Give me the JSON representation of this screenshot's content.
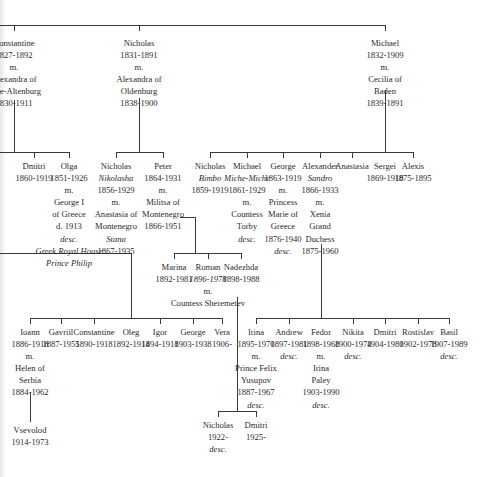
{
  "generation1": [
    {
      "id": "constantine",
      "lines": [
        {
          "t": "Constantine"
        },
        {
          "t": "1827-1892"
        },
        {
          "t": "m."
        },
        {
          "t": "Alexandra of"
        },
        {
          "t": "Saxe-Altenburg"
        },
        {
          "t": "1830-1911"
        }
      ]
    },
    {
      "id": "nicholas",
      "lines": [
        {
          "t": "Nicholas"
        },
        {
          "t": "1831-1891"
        },
        {
          "t": "m."
        },
        {
          "t": "Alexandra of"
        },
        {
          "t": "Oldenburg"
        },
        {
          "t": "1838-1900"
        }
      ]
    },
    {
      "id": "michael",
      "lines": [
        {
          "t": "Michael"
        },
        {
          "t": "1832-1909"
        },
        {
          "t": "m."
        },
        {
          "t": "Cecilia of"
        },
        {
          "t": "Baden"
        },
        {
          "t": "1839-1891"
        }
      ]
    }
  ],
  "generation2": [
    {
      "id": "dmitri-c",
      "lines": [
        {
          "t": "Dmitri"
        },
        {
          "t": "1860-1919"
        }
      ]
    },
    {
      "id": "olga",
      "lines": [
        {
          "t": "Olga"
        },
        {
          "t": "1851-1926"
        },
        {
          "t": "m."
        },
        {
          "t": "George I"
        },
        {
          "t": "of Greece"
        },
        {
          "t": "d. 1913"
        },
        {
          "t": "desc.",
          "i": true
        },
        {
          "t": "Greek Royal House",
          "i": true
        },
        {
          "t": "Prince Philip",
          "i": true
        }
      ]
    },
    {
      "id": "nicholas-n",
      "lines": [
        {
          "t": "Nicholas"
        },
        {
          "t": "Nikolasha",
          "i": true
        },
        {
          "t": "1856-1929"
        },
        {
          "t": "m."
        },
        {
          "t": "Anastasia of"
        },
        {
          "t": "Montenegro"
        },
        {
          "t": "Stana",
          "i": true
        },
        {
          "t": "1867-1935"
        }
      ]
    },
    {
      "id": "peter",
      "lines": [
        {
          "t": "Peter"
        },
        {
          "t": "1864-1931"
        },
        {
          "t": "m."
        },
        {
          "t": "Militsa of"
        },
        {
          "t": "Montenegro"
        },
        {
          "t": "1866-1951"
        }
      ]
    },
    {
      "id": "nicholas-m",
      "lines": [
        {
          "t": "Nicholas"
        },
        {
          "t": "Bimbo",
          "i": true
        },
        {
          "t": "1859-1919"
        }
      ]
    },
    {
      "id": "michael-m",
      "lines": [
        {
          "t": "Michael"
        },
        {
          "t": "Miche-Miche",
          "i": true
        },
        {
          "t": "1861-1929"
        },
        {
          "t": "m."
        },
        {
          "t": "Countess"
        },
        {
          "t": "Torby"
        },
        {
          "t": "desc.",
          "i": true
        }
      ]
    },
    {
      "id": "george-m",
      "lines": [
        {
          "t": "George"
        },
        {
          "t": "1863-1919"
        },
        {
          "t": "m."
        },
        {
          "t": "Princess"
        },
        {
          "t": "Marie of"
        },
        {
          "t": "Greece"
        },
        {
          "t": "1876-1940"
        },
        {
          "t": "desc.",
          "i": true
        }
      ]
    },
    {
      "id": "alexander",
      "lines": [
        {
          "t": "Alexander"
        },
        {
          "t": "Sandro",
          "i": true
        },
        {
          "t": "1866-1933"
        },
        {
          "t": "m."
        },
        {
          "t": "Xenia"
        },
        {
          "t": "Grand"
        },
        {
          "t": "Duchess"
        },
        {
          "t": "1875-1960"
        }
      ]
    },
    {
      "id": "anastasia",
      "lines": [
        {
          "t": "Anastasia"
        }
      ]
    },
    {
      "id": "sergei",
      "lines": [
        {
          "t": "Sergei"
        },
        {
          "t": "1869-1918"
        }
      ]
    },
    {
      "id": "alexis",
      "lines": [
        {
          "t": "Alexis"
        },
        {
          "t": "1875-1895"
        }
      ]
    }
  ],
  "generation3": [
    {
      "id": "marina",
      "lines": [
        {
          "t": "Marina"
        },
        {
          "t": "1892-1981"
        }
      ]
    },
    {
      "id": "roman",
      "lines": [
        {
          "t": "Roman"
        },
        {
          "t": "1896-1978",
          "i": true
        },
        {
          "t": "m."
        },
        {
          "t": "Countess Sheremetev"
        }
      ]
    },
    {
      "id": "nadezhda",
      "lines": [
        {
          "t": "Nadezhda"
        },
        {
          "t": "1898-1988"
        }
      ]
    },
    {
      "id": "ioann",
      "lines": [
        {
          "t": "Ioann"
        },
        {
          "t": "1886-1918"
        },
        {
          "t": "m."
        },
        {
          "t": "Helen of"
        },
        {
          "t": "Serbia"
        },
        {
          "t": "1884-1962"
        }
      ]
    },
    {
      "id": "gavriil",
      "lines": [
        {
          "t": "Gavriil"
        },
        {
          "t": "1887-1955"
        }
      ]
    },
    {
      "id": "constantine-k",
      "lines": [
        {
          "t": "Constantine"
        },
        {
          "t": "1890-1918"
        }
      ]
    },
    {
      "id": "oleg",
      "lines": [
        {
          "t": "Oleg"
        },
        {
          "t": "1892-1914"
        }
      ]
    },
    {
      "id": "igor",
      "lines": [
        {
          "t": "Igor"
        },
        {
          "t": "1894-1918"
        }
      ]
    },
    {
      "id": "george-k",
      "lines": [
        {
          "t": "George"
        },
        {
          "t": "1903-1938"
        }
      ]
    },
    {
      "id": "vera",
      "lines": [
        {
          "t": "Vera"
        },
        {
          "t": "1906-"
        }
      ]
    },
    {
      "id": "irina",
      "lines": [
        {
          "t": "Irina"
        },
        {
          "t": "1895-1970"
        },
        {
          "t": "m."
        },
        {
          "t": "Prince Felix"
        },
        {
          "t": "Yusupov"
        },
        {
          "t": "1887-1967"
        },
        {
          "t": "desc.",
          "i": true
        }
      ]
    },
    {
      "id": "andrew",
      "lines": [
        {
          "t": "Andrew"
        },
        {
          "t": "1897-1981"
        },
        {
          "t": "desc.",
          "i": true
        }
      ]
    },
    {
      "id": "fedor",
      "lines": [
        {
          "t": "Fedor"
        },
        {
          "t": "1898-1968"
        },
        {
          "t": "m."
        },
        {
          "t": "Irina"
        },
        {
          "t": "Paley"
        },
        {
          "t": "1903-1990"
        },
        {
          "t": "desc.",
          "i": true
        }
      ]
    },
    {
      "id": "nikita",
      "lines": [
        {
          "t": "Nikita"
        },
        {
          "t": "1900-1974"
        },
        {
          "t": "desc.",
          "i": true
        }
      ]
    },
    {
      "id": "dmitri-a",
      "lines": [
        {
          "t": "Dmitri"
        },
        {
          "t": "1904-1980"
        }
      ]
    },
    {
      "id": "rostislav",
      "lines": [
        {
          "t": "Rostislav"
        },
        {
          "t": "1902-1978"
        }
      ]
    },
    {
      "id": "basil",
      "lines": [
        {
          "t": "Basil"
        },
        {
          "t": "1907-1989"
        },
        {
          "t": "desc.",
          "i": true
        }
      ]
    }
  ],
  "generation4": [
    {
      "id": "vsevolod",
      "lines": [
        {
          "t": "Vsevolod"
        },
        {
          "t": "1914-1973"
        }
      ]
    },
    {
      "id": "nicholas-r",
      "lines": [
        {
          "t": "Nicholas"
        },
        {
          "t": "1922-"
        },
        {
          "t": "desc.",
          "i": true
        }
      ]
    },
    {
      "id": "dmitri-r",
      "lines": [
        {
          "t": "Dmitri"
        },
        {
          "t": "1925-"
        }
      ]
    }
  ],
  "colors": {
    "line": "#3a3a3a",
    "text": "#2a2a2a",
    "background": "#ffffff"
  }
}
